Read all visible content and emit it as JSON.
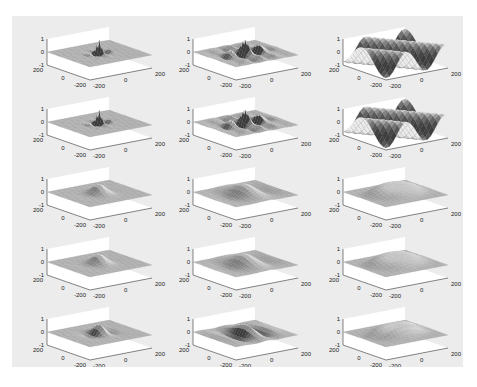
{
  "figure": {
    "background": "#ececec",
    "caption": ""
  },
  "chart_data": {
    "type": "surface-grid",
    "title": "",
    "rows": 5,
    "cols": 3,
    "axes": {
      "x_ticks": [
        "-200",
        "0",
        "200"
      ],
      "y_ticks": [
        "-200",
        "0",
        "200"
      ],
      "z_ticks": [
        "-1",
        "0",
        "1"
      ],
      "xlim": [
        -200,
        200
      ],
      "ylim": [
        -200,
        200
      ],
      "zlim": [
        -1,
        1
      ],
      "grid": false
    },
    "panels": [
      {
        "row": 1,
        "col": 1,
        "kind": "ripple",
        "freq": 0.06,
        "spread": 35
      },
      {
        "row": 1,
        "col": 2,
        "kind": "ripple",
        "freq": 0.04,
        "spread": 80
      },
      {
        "row": 1,
        "col": 3,
        "kind": "wave",
        "freq": 0.025,
        "spread": 400
      },
      {
        "row": 2,
        "col": 1,
        "kind": "ripple",
        "freq": 0.06,
        "spread": 35
      },
      {
        "row": 2,
        "col": 2,
        "kind": "ripple",
        "freq": 0.04,
        "spread": 80
      },
      {
        "row": 2,
        "col": 3,
        "kind": "wave",
        "freq": 0.025,
        "spread": 400
      },
      {
        "row": 3,
        "col": 1,
        "kind": "bump",
        "freq": 0.01,
        "spread": 45
      },
      {
        "row": 3,
        "col": 2,
        "kind": "bump",
        "freq": 0.01,
        "spread": 85
      },
      {
        "row": 3,
        "col": 3,
        "kind": "plateau",
        "freq": 0.01,
        "spread": 150
      },
      {
        "row": 4,
        "col": 1,
        "kind": "bump",
        "freq": 0.01,
        "spread": 45
      },
      {
        "row": 4,
        "col": 2,
        "kind": "bump",
        "freq": 0.01,
        "spread": 85
      },
      {
        "row": 4,
        "col": 3,
        "kind": "plateau",
        "freq": 0.01,
        "spread": 150
      },
      {
        "row": 5,
        "col": 1,
        "kind": "bump",
        "freq": 0.02,
        "spread": 45
      },
      {
        "row": 5,
        "col": 2,
        "kind": "bump",
        "freq": 0.02,
        "spread": 85
      },
      {
        "row": 5,
        "col": 3,
        "kind": "plateau",
        "freq": 0.02,
        "spread": 150
      }
    ]
  }
}
